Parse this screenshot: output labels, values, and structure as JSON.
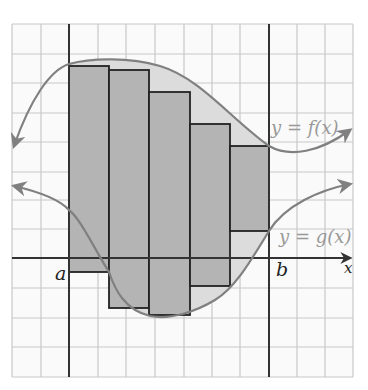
{
  "figure": {
    "type": "area-between-curves-riemann",
    "grid": {
      "left": 12,
      "right": 353,
      "top": 24,
      "bottom": 377,
      "xlines": [
        12,
        41,
        69,
        98,
        126,
        155,
        184,
        212,
        240,
        269,
        297,
        325,
        353
      ],
      "ylines": [
        24,
        54,
        83,
        113,
        142,
        172,
        200,
        229,
        258,
        288,
        318,
        347,
        377
      ]
    },
    "axes": {
      "x_axis_y": 258,
      "x_axis_start": 12,
      "x_axis_end": 352,
      "y_axis_x": 69
    },
    "labels": {
      "a": "a",
      "b": "b",
      "x": "x",
      "f_label": "y = f(x)",
      "g_label": "y = g(x)"
    },
    "rectangles": [
      {
        "x1": 69,
        "x2": 109,
        "top": 66,
        "bottom": 272
      },
      {
        "x1": 109,
        "x2": 149,
        "top": 70,
        "bottom": 308
      },
      {
        "x1": 149,
        "x2": 190,
        "top": 92,
        "bottom": 315
      },
      {
        "x1": 190,
        "x2": 230,
        "top": 124,
        "bottom": 286
      },
      {
        "x1": 230,
        "x2": 269,
        "top": 146,
        "bottom": 231
      }
    ],
    "colors": {
      "grid": "#c8c8c8",
      "axis": "#333333",
      "curve": "#808080",
      "rect_fill": "#b4b4b4",
      "region_fill": "#dcdcdc",
      "rect_stroke": "#222222",
      "label": "#999999",
      "ab_label": "#222222"
    }
  }
}
